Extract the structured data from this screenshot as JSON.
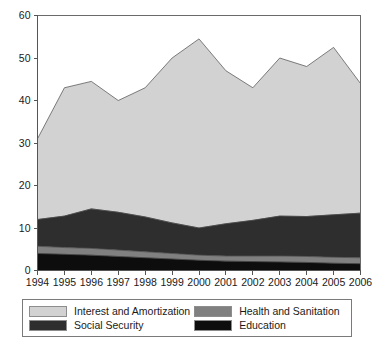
{
  "chart_data": {
    "type": "area",
    "stacked": true,
    "title": "",
    "xlabel": "",
    "ylabel": "",
    "grid": false,
    "legend_position": "bottom",
    "xlim": [
      1994,
      2006
    ],
    "ylim": [
      0,
      60
    ],
    "ytick_labels": [
      "0",
      "10",
      "20",
      "30",
      "40",
      "50",
      "60"
    ],
    "yticks": [
      0,
      10,
      20,
      30,
      40,
      50,
      60
    ],
    "categories": [
      1994,
      1995,
      1996,
      1997,
      1998,
      1999,
      2000,
      2001,
      2002,
      2003,
      2004,
      2005,
      2006
    ],
    "xtick_labels": [
      "1994",
      "1995",
      "1996",
      "1997",
      "1998",
      "1999",
      "2000",
      "2001",
      "2002",
      "2003",
      "2004",
      "2005",
      "2006"
    ],
    "stack_order_bottom_to_top": [
      "Education",
      "Health and Sanitation",
      "Social Security",
      "Interest and Amortization"
    ],
    "series": [
      {
        "name": "Education",
        "color": "#0d0d0d",
        "values": [
          4.0,
          3.8,
          3.6,
          3.3,
          3.0,
          2.7,
          2.4,
          2.2,
          2.1,
          2.0,
          1.9,
          1.7,
          1.6
        ]
      },
      {
        "name": "Health and Sanitation",
        "color": "#808080",
        "values": [
          1.7,
          1.6,
          1.6,
          1.5,
          1.4,
          1.3,
          1.2,
          1.2,
          1.3,
          1.4,
          1.4,
          1.4,
          1.4
        ]
      },
      {
        "name": "Social Security",
        "color": "#2e2e2e",
        "values": [
          6.3,
          7.4,
          9.3,
          8.9,
          8.2,
          7.2,
          6.4,
          7.6,
          8.4,
          9.4,
          9.4,
          10.0,
          10.5
        ]
      },
      {
        "name": "Interest and Amortization",
        "color": "#d2d2d2",
        "values": [
          19.0,
          30.2,
          30.0,
          26.3,
          30.4,
          38.8,
          44.5,
          36.0,
          31.2,
          37.2,
          35.3,
          39.4,
          30.5
        ]
      }
    ],
    "cumulative_totals": [
      31.0,
      43.0,
      44.5,
      40.0,
      43.0,
      50.0,
      54.5,
      47.0,
      43.0,
      50.0,
      48.0,
      52.5,
      44.0
    ]
  },
  "legend": {
    "items": [
      {
        "label": "Interest and Amortization",
        "color": "#d2d2d2"
      },
      {
        "label": "Health and Sanitation",
        "color": "#808080"
      },
      {
        "label": "Social Security",
        "color": "#2e2e2e"
      },
      {
        "label": "Education",
        "color": "#0d0d0d"
      }
    ]
  }
}
